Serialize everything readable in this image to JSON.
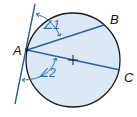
{
  "diagram": {
    "type": "geometry-circle-tangent",
    "colors": {
      "circle_fill": "#dbe9f5",
      "circle_stroke": "#1a1a1a",
      "line_color": "#2a5fb0",
      "angle_label_color": "#2a6ebb",
      "point_label_color": "#111111"
    },
    "points": {
      "A": {
        "label": "A",
        "x": 27,
        "y": 50
      },
      "B": {
        "label": "B",
        "x": 104,
        "y": 25
      },
      "C": {
        "label": "C",
        "x": 120,
        "y": 70
      },
      "center": {
        "x": 73,
        "y": 60
      }
    },
    "circle": {
      "cx": 73,
      "cy": 60,
      "r": 47
    },
    "tangent": {
      "x1": 35,
      "y1": 4,
      "x2": 15,
      "y2": 104
    },
    "angles": [
      {
        "label": "∠1",
        "between": [
          "tangent",
          "AB"
        ]
      },
      {
        "label": "∠2",
        "between": [
          "tangent",
          "AC"
        ]
      }
    ]
  }
}
